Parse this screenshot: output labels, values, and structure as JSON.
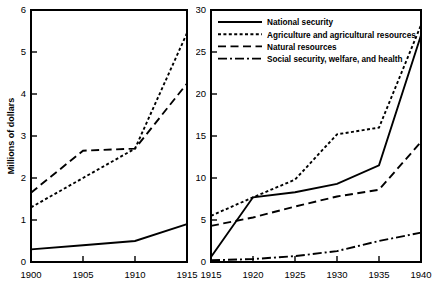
{
  "figure": {
    "background": "#ffffff",
    "ink": "#000000"
  },
  "chart_data": [
    {
      "type": "line",
      "title": "",
      "panel": "left",
      "xlabel": "",
      "ylabel": "Millions of dollars",
      "x": [
        1900,
        1905,
        1910,
        1915
      ],
      "xlim": [
        1900,
        1915
      ],
      "ylim": [
        0,
        6
      ],
      "xticks": [
        1900,
        1905,
        1910,
        1915
      ],
      "xticklabels": [
        "1900",
        "1905",
        "1910",
        "1915"
      ],
      "yticks": [
        0,
        1,
        2,
        3,
        4,
        5,
        6
      ],
      "yticklabels": [
        "0",
        "1",
        "2",
        "3",
        "4",
        "5",
        "6"
      ],
      "grid": false,
      "legend": "none",
      "series": [
        {
          "name": "National security",
          "style": "solid",
          "values": [
            0.3,
            0.4,
            0.5,
            0.9
          ]
        },
        {
          "name": "Agriculture and agricultural resources",
          "style": "dotted",
          "values": [
            1.3,
            2.0,
            2.7,
            5.45
          ]
        },
        {
          "name": "Natural resources",
          "style": "dashed",
          "values": [
            1.65,
            2.65,
            2.7,
            4.25
          ]
        }
      ]
    },
    {
      "type": "line",
      "title": "",
      "panel": "right",
      "xlabel": "",
      "ylabel": "Millions of dollars",
      "x": [
        1915,
        1920,
        1925,
        1930,
        1935,
        1940
      ],
      "xlim": [
        1915,
        1940
      ],
      "ylim": [
        0,
        30
      ],
      "xticks": [
        1915,
        1920,
        1925,
        1930,
        1935,
        1940
      ],
      "xticklabels": [
        "1915",
        "1920",
        "1925",
        "1930",
        "1935",
        "1940"
      ],
      "yticks": [
        0,
        5,
        10,
        15,
        20,
        25,
        30
      ],
      "yticklabels": [
        "0",
        "5",
        "10",
        "15",
        "20",
        "25",
        "30"
      ],
      "grid": false,
      "legend": "upper left",
      "series": [
        {
          "name": "National security",
          "style": "solid",
          "values": [
            0.6,
            7.7,
            8.3,
            9.3,
            11.5,
            27.0
          ]
        },
        {
          "name": "Agriculture and agricultural resources",
          "style": "dotted",
          "values": [
            5.5,
            7.7,
            9.8,
            15.2,
            16.0,
            28.2
          ]
        },
        {
          "name": "Natural resources",
          "style": "dashed",
          "values": [
            4.3,
            5.3,
            6.6,
            7.8,
            8.6,
            14.3
          ]
        },
        {
          "name": "Social security, welfare, and health",
          "style": "dashdot",
          "values": [
            0.2,
            0.35,
            0.7,
            1.3,
            2.5,
            3.5
          ]
        }
      ]
    }
  ],
  "left_panel": {
    "ylabel": "Millions of dollars",
    "yticklabels": [
      "0",
      "1",
      "2",
      "3",
      "4",
      "5",
      "6"
    ],
    "xticklabels": [
      "1900",
      "1905",
      "1910",
      "1915"
    ]
  },
  "right_panel": {
    "ylabel": "Millions of dollars",
    "yticklabels": [
      "0",
      "5",
      "10",
      "15",
      "20",
      "25",
      "30"
    ],
    "xticklabels": [
      "1915",
      "1920",
      "1925",
      "1930",
      "1935",
      "1940"
    ],
    "legend": {
      "items": [
        {
          "label": "National security",
          "style": "solid"
        },
        {
          "label": "Agriculture and agricultural resources",
          "style": "dotted"
        },
        {
          "label": "Natural resources",
          "style": "dashed"
        },
        {
          "label": "Social security, welfare, and health",
          "style": "dashdot"
        }
      ]
    }
  }
}
